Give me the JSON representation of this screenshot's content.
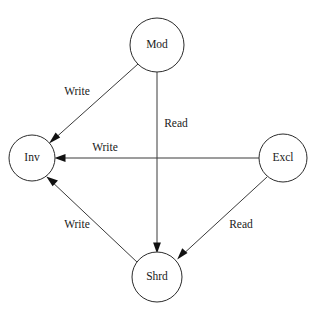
{
  "diagram": {
    "type": "state-transition-diagram",
    "background_color": "#ffffff",
    "node_stroke_color": "#2b2b2b",
    "node_fill_color": "#ffffff",
    "edge_color": "#3a3a3a",
    "text_color": "#1a1a1a",
    "nodes": [
      {
        "id": "mod",
        "label": "Mod",
        "cx": 157,
        "cy": 45,
        "r": 27
      },
      {
        "id": "inv",
        "label": "Inv",
        "cx": 32,
        "cy": 158,
        "r": 23
      },
      {
        "id": "excl",
        "label": "Excl",
        "cx": 283,
        "cy": 158,
        "r": 24
      },
      {
        "id": "shrd",
        "label": "Shrd",
        "cx": 157,
        "cy": 277,
        "r": 25
      }
    ],
    "edges": [
      {
        "id": "mod-to-inv",
        "from": "mod",
        "to": "inv",
        "label": "Write",
        "label_x": 77,
        "label_y": 92,
        "x1": 138,
        "y1": 64,
        "x2": 49,
        "y2": 143
      },
      {
        "id": "mod-to-shrd",
        "from": "mod",
        "to": "shrd",
        "label": "Read",
        "label_x": 176,
        "label_y": 124,
        "x1": 157,
        "y1": 72,
        "x2": 157,
        "y2": 252
      },
      {
        "id": "excl-to-inv",
        "from": "excl",
        "to": "inv",
        "label": "Write",
        "label_x": 105,
        "label_y": 148,
        "x1": 259,
        "y1": 158,
        "x2": 55,
        "y2": 158
      },
      {
        "id": "excl-to-shrd",
        "from": "excl",
        "to": "shrd",
        "label": "Read",
        "label_x": 241,
        "label_y": 225,
        "x1": 267,
        "y1": 177,
        "x2": 177,
        "y2": 260
      },
      {
        "id": "shrd-to-inv",
        "from": "shrd",
        "to": "inv",
        "label": "Write",
        "label_x": 77,
        "label_y": 225,
        "x1": 138,
        "y1": 263,
        "x2": 46,
        "y2": 176
      }
    ]
  }
}
